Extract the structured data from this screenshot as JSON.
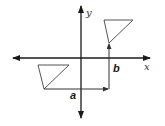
{
  "diagram": {
    "title": "",
    "axes": {
      "x_label": "x",
      "y_label": "y",
      "origin": [
        81,
        58
      ]
    },
    "shapes": [
      {
        "id": "original-triangle",
        "points": [
          [
            38,
            65
          ],
          [
            69,
            65
          ],
          [
            44,
            89
          ]
        ]
      },
      {
        "id": "translated-triangle",
        "points": [
          [
            104,
            20
          ],
          [
            133,
            20
          ],
          [
            109,
            43
          ]
        ]
      }
    ],
    "vectors": [
      {
        "id": "horizontal",
        "label": "a",
        "from": [
          44,
          89
        ],
        "to": [
          107,
          89
        ]
      },
      {
        "id": "vertical",
        "label": "b",
        "from": [
          109,
          89
        ],
        "to": [
          109,
          45
        ]
      }
    ],
    "colors": {
      "axis": "#1a1a1a",
      "triangle": "#555555",
      "vector": "#333333"
    }
  }
}
